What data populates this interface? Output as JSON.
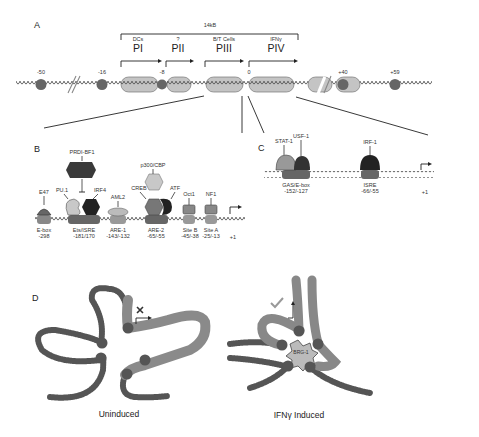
{
  "panels": {
    "a": "A",
    "b": "B",
    "c": "C",
    "d": "D"
  },
  "panel_a": {
    "span_label": "14kB",
    "promoters": [
      {
        "name": "PI",
        "cell": "DCs",
        "x": 138
      },
      {
        "name": "PII",
        "cell": "?",
        "x": 178
      },
      {
        "name": "PIII",
        "cell": "B/T Cells",
        "x": 224
      },
      {
        "name": "PIV",
        "cell": "IFNγ",
        "x": 276
      }
    ],
    "positions": [
      {
        "label": "-50",
        "x": 41
      },
      {
        "label": "-16",
        "x": 102
      },
      {
        "label": "-8",
        "x": 162
      },
      {
        "label": "0",
        "x": 248
      },
      {
        "label": "+40",
        "x": 343
      },
      {
        "label": "+59",
        "x": 395
      }
    ]
  },
  "panel_b": {
    "factors": [
      {
        "name": "PRDI-BF1",
        "x": 82
      },
      {
        "name": "E47",
        "x": 44
      },
      {
        "name": "PU.1",
        "x": 62
      },
      {
        "name": "IRF4",
        "x": 100
      },
      {
        "name": "AML2",
        "x": 118
      },
      {
        "name": "p300/CBP",
        "x": 153
      },
      {
        "name": "CREB",
        "x": 139
      },
      {
        "name": "ATF",
        "x": 175
      },
      {
        "name": "Oct1",
        "x": 187
      },
      {
        "name": "NF1",
        "x": 210
      }
    ],
    "elements": [
      {
        "name": "E-box",
        "pos": "-298",
        "x": 44
      },
      {
        "name": "Ets/ISRE",
        "pos": "-181/170",
        "x": 84
      },
      {
        "name": "ARE-1",
        "pos": "-143/-132",
        "x": 118
      },
      {
        "name": "ARE-2",
        "pos": "-65/-55",
        "x": 156
      },
      {
        "name": "Site B",
        "pos": "-45/-38",
        "x": 190
      },
      {
        "name": "Site A",
        "pos": "-25/-13",
        "x": 211
      },
      {
        "name": "",
        "pos": "+1",
        "x": 235
      }
    ]
  },
  "panel_c": {
    "factors": [
      {
        "name": "STAT-1",
        "x": 284
      },
      {
        "name": "USF-1",
        "x": 301
      },
      {
        "name": "IRF-1",
        "x": 370
      }
    ],
    "elements": [
      {
        "name": "GAS/E-box",
        "pos": "-152/-127",
        "x": 296
      },
      {
        "name": "ISRE",
        "pos": "-66/-55",
        "x": 370
      },
      {
        "name": "",
        "pos": "+1",
        "x": 425
      }
    ]
  },
  "panel_d": {
    "uninduced_label": "Uninduced",
    "induced_label": "IFNγ Induced",
    "hub_label": "BRG-1"
  },
  "colors": {
    "nucleosome": "#bdbdbd",
    "dark_factor": "#3a3a3a",
    "mid_factor": "#8a8a8a",
    "light_factor": "#c8c8c8",
    "line": "#222222"
  }
}
